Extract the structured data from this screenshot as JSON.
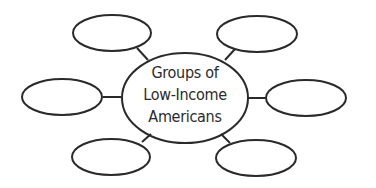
{
  "diagram": {
    "type": "web-organizer",
    "stroke_color": "#2a2a2a",
    "background": "#ffffff",
    "center": {
      "lines": [
        "Groups of",
        "Low-Income",
        "Americans"
      ]
    },
    "satellites": [
      {
        "position": "top-left",
        "label": ""
      },
      {
        "position": "top-right",
        "label": ""
      },
      {
        "position": "left",
        "label": ""
      },
      {
        "position": "right",
        "label": ""
      },
      {
        "position": "bottom-left",
        "label": ""
      },
      {
        "position": "bottom-right",
        "label": ""
      }
    ]
  }
}
